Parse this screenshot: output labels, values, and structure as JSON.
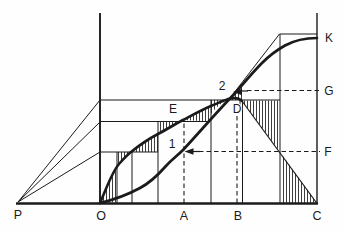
{
  "diagram": {
    "background": "#fefefe",
    "ink_color": "#1b1b1b",
    "labels": {
      "p": "P",
      "o": "O",
      "a": "A",
      "b": "B",
      "c": "C",
      "d": "D",
      "e": "E",
      "k": "K",
      "f": "F",
      "g": "G",
      "point1": "1",
      "point2": "2"
    }
  }
}
